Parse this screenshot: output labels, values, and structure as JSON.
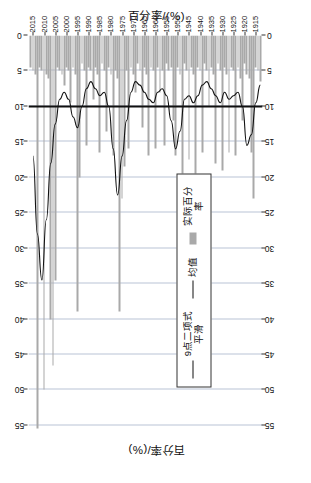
{
  "chart_data": {
    "type": "bar",
    "title": "",
    "ylabel_left": "百分率/(%)",
    "ylabel_right": "百分率/(%)",
    "xlabel": "",
    "value_ticks": [
      0,
      5,
      10,
      15,
      20,
      25,
      30,
      35,
      40,
      45,
      50,
      55
    ],
    "ylim": [
      0,
      57
    ],
    "grid": true,
    "legend_position": "left-center",
    "legend": [
      "9点二项式平滑",
      "均值",
      "实际百分率"
    ],
    "mean_value": 10,
    "year_ticks": [
      1915,
      1920,
      1925,
      1930,
      1935,
      1940,
      1945,
      1950,
      1955,
      1960,
      1965,
      1970,
      1975,
      1980,
      1985,
      1990,
      1995,
      2000,
      2005,
      2010,
      2015
    ],
    "xlim": [
      1912,
      2017
    ],
    "series": [
      {
        "name": "实际百分率",
        "type": "bar",
        "x": [
          1913,
          1914,
          1915,
          1916,
          1917,
          1918,
          1919,
          1920,
          1921,
          1922,
          1923,
          1924,
          1925,
          1926,
          1927,
          1928,
          1929,
          1930,
          1931,
          1932,
          1933,
          1934,
          1935,
          1936,
          1937,
          1938,
          1939,
          1940,
          1941,
          1942,
          1943,
          1944,
          1945,
          1946,
          1947,
          1948,
          1949,
          1950,
          1951,
          1952,
          1953,
          1954,
          1955,
          1956,
          1957,
          1958,
          1959,
          1960,
          1961,
          1962,
          1963,
          1964,
          1965,
          1966,
          1967,
          1968,
          1969,
          1970,
          1971,
          1972,
          1973,
          1974,
          1975,
          1976,
          1977,
          1978,
          1979,
          1980,
          1981,
          1982,
          1983,
          1984,
          1985,
          1986,
          1987,
          1988,
          1989,
          1990,
          1991,
          1992,
          1993,
          1994,
          1995,
          1996,
          1997,
          1998,
          1999,
          2000,
          2001,
          2002,
          2003,
          2004,
          2005,
          2006,
          2007,
          2008,
          2009,
          2010,
          2011,
          2012,
          2013,
          2014,
          2015,
          2016
        ],
        "values": [
          6.5,
          5.0,
          4.5,
          23.0,
          16.5,
          6.0,
          5.5,
          4.0,
          12.0,
          6.0,
          4.5,
          17.0,
          5.0,
          4.5,
          16.5,
          5.5,
          4.5,
          19.0,
          5.0,
          4.0,
          18.0,
          5.5,
          4.5,
          10.0,
          5.0,
          4.0,
          16.5,
          5.0,
          4.5,
          20.0,
          5.5,
          4.5,
          17.5,
          5.0,
          4.0,
          28.0,
          5.5,
          4.5,
          17.0,
          12.0,
          4.5,
          5.0,
          4.0,
          15.5,
          5.0,
          8.0,
          4.5,
          16.0,
          5.0,
          4.5,
          17.0,
          5.5,
          4.5,
          13.0,
          5.0,
          4.0,
          8.0,
          5.5,
          4.5,
          16.0,
          5.0,
          18.5,
          23.0,
          39.0,
          6.0,
          5.0,
          17.0,
          5.5,
          4.5,
          13.5,
          5.0,
          4.0,
          16.5,
          5.5,
          4.5,
          9.0,
          5.0,
          4.5,
          15.5,
          5.0,
          4.0,
          20.0,
          39.0,
          5.5,
          4.5,
          9.5,
          5.0,
          4.5,
          7.0,
          5.5,
          5.0,
          4.5,
          34.5,
          46.5,
          40.0,
          6.0,
          5.5,
          50.0,
          5.0,
          4.5,
          55.5,
          5.5,
          5.0,
          4.5
        ]
      },
      {
        "name": "9点二项式平滑",
        "type": "line",
        "x": [
          1913,
          1915,
          1917,
          1919,
          1921,
          1923,
          1925,
          1927,
          1929,
          1931,
          1933,
          1935,
          1937,
          1939,
          1941,
          1943,
          1945,
          1947,
          1949,
          1951,
          1953,
          1955,
          1957,
          1959,
          1961,
          1963,
          1965,
          1967,
          1969,
          1971,
          1973,
          1975,
          1977,
          1979,
          1981,
          1983,
          1985,
          1987,
          1989,
          1991,
          1993,
          1995,
          1997,
          1999,
          2001,
          2003,
          2005,
          2007,
          2009,
          2011,
          2013,
          2015
        ],
        "values": [
          7.0,
          9.5,
          14.0,
          15.5,
          10.0,
          8.0,
          8.5,
          9.0,
          8.0,
          9.5,
          8.5,
          7.5,
          6.5,
          7.0,
          8.5,
          9.5,
          8.5,
          9.0,
          13.5,
          16.0,
          12.0,
          8.5,
          7.5,
          8.0,
          9.5,
          9.0,
          8.0,
          7.0,
          6.5,
          8.0,
          12.0,
          17.0,
          22.5,
          16.0,
          10.0,
          8.0,
          8.5,
          7.5,
          6.5,
          7.5,
          10.0,
          13.0,
          11.5,
          9.0,
          8.0,
          9.0,
          12.5,
          18.0,
          26.0,
          34.5,
          28.0,
          17.0
        ]
      },
      {
        "name": "均值",
        "type": "vline",
        "value": 10
      }
    ]
  }
}
